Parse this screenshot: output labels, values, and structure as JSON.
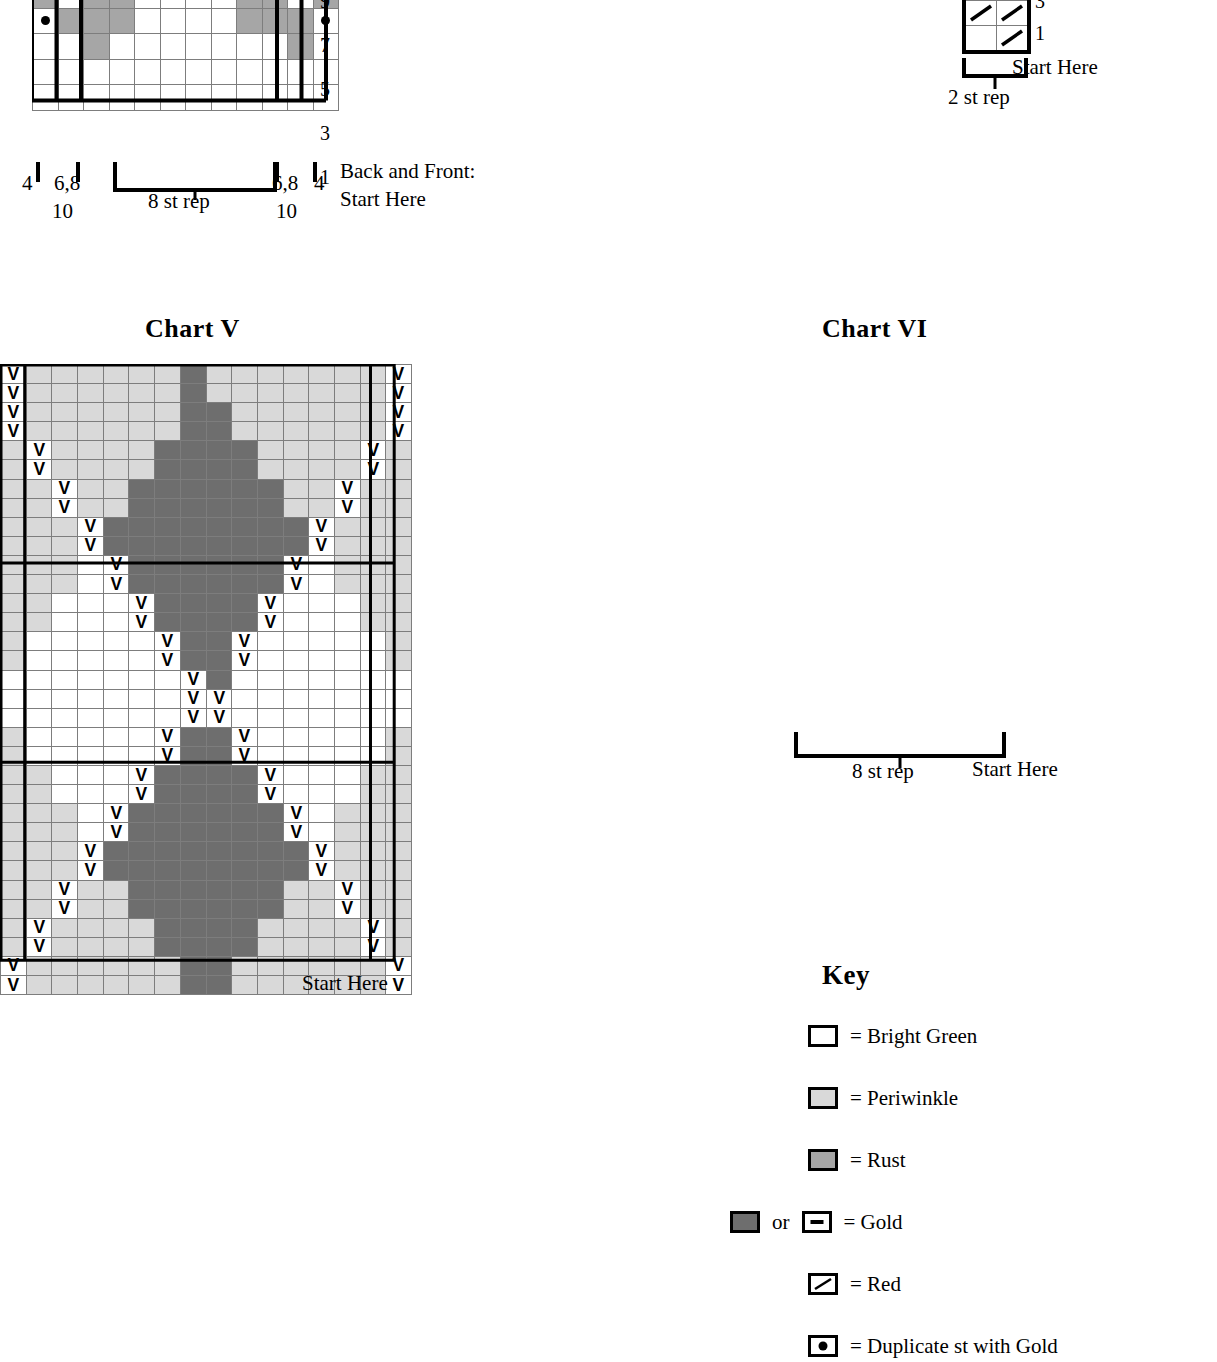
{
  "colors": {
    "bright_green": "#ffffff",
    "periwinkle": "#d9d9d9",
    "rust": "#a6a6a6",
    "gold": "#6e6e6e",
    "line": "#7d7d7d",
    "heavy": "#000000"
  },
  "chart_top_left": {
    "caption_line1": "Back and Front:",
    "caption_line2": "Start Here",
    "rep_label": "8 st rep",
    "row_numbers": [
      "9",
      "7",
      "5",
      "3",
      "1"
    ],
    "edge_labels": {
      "far_left": "4",
      "left_inner": "6,8",
      "left_lower": "10",
      "right_inner": "6,8",
      "far_right": "4",
      "right_lower": "10"
    }
  },
  "chart_top_right": {
    "row_numbers": [
      "3",
      "1"
    ],
    "start_here": "Start Here",
    "rep_label": "2 st rep"
  },
  "chart_v": {
    "title": "Chart V",
    "start_here": "Start Here",
    "cols": 16,
    "rows": 33,
    "row_numbers": [
      "33",
      "31",
      "29",
      "27",
      "25",
      "23",
      "21",
      "19",
      "17",
      "15",
      "13",
      "11",
      "9",
      "7",
      "5",
      "3",
      "1"
    ]
  },
  "chart_vi": {
    "title": "Chart VI",
    "rep_label": "8 st rep",
    "start_here": "Start Here",
    "rows": 19,
    "row_numbers": [
      "19",
      "17",
      "15",
      "13",
      "11",
      "9",
      "7",
      "5",
      "3",
      "1"
    ]
  },
  "key": {
    "title": "Key",
    "or_label": "or",
    "items": [
      {
        "symbol": "empty",
        "swatch": "#ffffff",
        "label": "= Bright Green"
      },
      {
        "symbol": "empty",
        "swatch": "#d9d9d9",
        "label": "= Periwinkle"
      },
      {
        "symbol": "empty",
        "swatch": "#a6a6a6",
        "label": "= Rust"
      },
      {
        "symbol": "dash",
        "swatch": "#6e6e6e",
        "label": "= Gold"
      },
      {
        "symbol": "slash",
        "swatch": "#ffffff",
        "label": "= Red"
      },
      {
        "symbol": "dot",
        "swatch": "#ffffff",
        "label": "= Duplicate st with Gold"
      }
    ]
  },
  "chart_data": {
    "type": "heatmap",
    "palette": {
      "W": "#ffffff",
      "P": "#d9d9d9",
      "R": "#a6a6a6",
      "G": "#6e6e6e"
    },
    "palette_names": {
      "W": "Bright Green",
      "P": "Periwinkle",
      "R": "Rust",
      "G": "Gold"
    },
    "charts": [
      {
        "name": "chart_top_left",
        "cols": 12,
        "rows": 9,
        "note": "rows 1-9 visible; chart is cropped at top of page",
        "rows_bottom_up": [
          "WWWWWWWWWWWW",
          "WWWWWWWWWWWW",
          "WWRWWWWWWWRW",
          "RRRRWWWWRRRR",
          "RRRRWWWWRRRR",
          "RRRRRPRRRRRR",
          "RRRRPPPPRRRR",
          "PRRRPPPPRRRP",
          "PPRRPPPPRRPP"
        ],
        "dots_bottom_up": [
          [],
          [],
          [],
          [
            0,
            11
          ],
          [
            1,
            10
          ],
          [
            2,
            9
          ],
          [
            3,
            8
          ],
          [
            4,
            7
          ],
          []
        ]
      },
      {
        "name": "chart_v",
        "cols": 16,
        "rows": 33,
        "rows_bottom_up": [
          "PPPPPPPGGPPPPPPP",
          "PPPPPPPGGPPPPPPP",
          "PPPPPPGGGGPPPPPP",
          "PPPPPPGGGGPPPPPP",
          "PPPPPGGGGGGPPPPP",
          "PPPPPGGGGGGPPPPP",
          "PPPPGGGGGGGGPPPP",
          "PPPPGGGGGGGGPPPP",
          "PPPWGGGGGGGGWPPP",
          "PPPWGGGGGGGGWPPP",
          "PPWWWGGGGGGWWWPP",
          "PPWWWGGGGGGWWWPP",
          "PWWWWWGGGGWWWWWP",
          "PWWWWWGGGGWWWWWP",
          "WWWWWWWGGWWWWWWW",
          "WWWWWWWGGWWWWWWW",
          "WWWWWWWGGWWWWWWW",
          "PWWWWWGGGGWWWWWP",
          "PWWWWWGGGGWWWWWP",
          "PPWWWGGGGGGWWWPP",
          "PPWWWGGGGGGWWWPP",
          "PPPWGGGGGGGGWPPP",
          "PPPWGGGGGGGGWPPP",
          "PPPPGGGGGGGGPPPP",
          "PPPPGGGGGGGGPPPP",
          "PPPPPGGGGGGPPPPP",
          "PPPPPGGGGGGPPPPP",
          "PPPPPPGGGGPPPPPP",
          "PPPPPPGGGGPPPPPP",
          "PPPPPPPGGPPPPPPP",
          "PPPPPPPGGPPPPPPP",
          "PPPPPPPGPPPPPPPP",
          "PPPPPPPGPPPPPPPP"
        ],
        "v_positions_bottom_up": [
          [
            0,
            15
          ],
          [
            0,
            15
          ],
          [
            1,
            14
          ],
          [
            1,
            14
          ],
          [
            2,
            13
          ],
          [
            2,
            13
          ],
          [
            3,
            12
          ],
          [
            3,
            12
          ],
          [
            4,
            11
          ],
          [
            4,
            11
          ],
          [
            5,
            10
          ],
          [
            5,
            10
          ],
          [
            6,
            9
          ],
          [
            6,
            9
          ],
          [
            7,
            8
          ],
          [
            7,
            8
          ],
          [
            7
          ],
          [
            6,
            9
          ],
          [
            6,
            9
          ],
          [
            5,
            10
          ],
          [
            5,
            10
          ],
          [
            4,
            11
          ],
          [
            4,
            11
          ],
          [
            3,
            12
          ],
          [
            3,
            12
          ],
          [
            2,
            13
          ],
          [
            2,
            13
          ],
          [
            1,
            14
          ],
          [
            1,
            14
          ],
          [
            0,
            15
          ],
          [
            0,
            15
          ],
          [
            0,
            15
          ],
          [
            0,
            15
          ]
        ]
      },
      {
        "name": "chart_vi",
        "rows": 19,
        "base_cols": 8,
        "max_cols": 26,
        "note": "triangular chart, widens by one stitch each side every two rows",
        "rows_bottom_up": [
          "WWWWWWWW",
          "WWWWWWWW",
          "RWWWWWWR",
          "RRWWWWRR",
          "RRRWWWRRRR",
          "RRRWWWRRRR",
          "RRRRPPRRRRRR",
          "RRRRPPRRRRRR",
          "RRRPPPPPRRRRRR",
          "RRRPPPPPRRRRRR",
          "RRPPPPPPPPRRRRRR",
          "RRPPPPPPPPRRRRRR",
          "RPPPPPPPPPPRRRRRRR",
          "RPPPPPPPPPPRRRRRRR",
          "RWWWRRRRRRWWWRRRRRRR",
          "RWWWRRRRRRWWWRRRRRRR",
          "WWWWWWWWWWWWWWWWWWWWWW",
          "WWWWWWWWWWWWWWWWWWWWWW",
          "WWWWWWWWWWWWWWWWWWWWWWWW"
        ]
      }
    ]
  }
}
